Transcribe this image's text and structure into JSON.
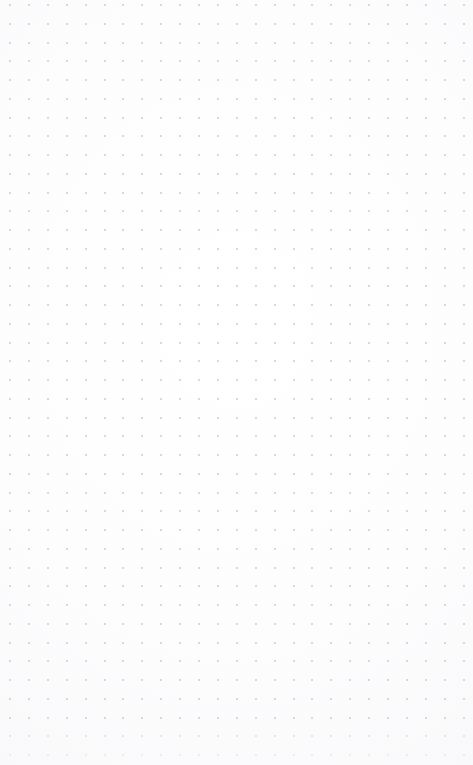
{
  "app": {
    "surface_name": "dot-grid-canvas",
    "state": "empty"
  },
  "canvas": {
    "width_px": 473,
    "height_px": 765,
    "background_color": "#fbfbfc",
    "edge_shade_color": "#f4f4f6"
  },
  "grid": {
    "pattern": "dots",
    "dot_color": "#c9c9ce",
    "dot_size_px": 2,
    "spacing_x_px": 18.9,
    "spacing_y_px": 18.75,
    "origin_x_px": 10,
    "origin_y_px": 5,
    "columns": 25,
    "rows": 41,
    "visible": true
  },
  "empty_state": {
    "message": ""
  }
}
